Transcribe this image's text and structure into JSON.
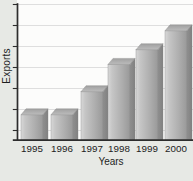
{
  "chart_data": {
    "type": "bar",
    "title": "",
    "categories": [
      "1995",
      "1996",
      "1997",
      "1998",
      "1999",
      "2000"
    ],
    "values": [
      1.2,
      1.2,
      2.3,
      3.6,
      4.3,
      5.2
    ],
    "values_note": "y-axis shows no numeric tick labels; values estimated in gridline divisions",
    "series_name": "Exports",
    "xlabel": "Years",
    "ylabel": "Exports",
    "ylim": [
      0,
      6.5
    ],
    "y_tick_count": 7,
    "x_tick_labels_visible": true,
    "y_tick_labels_visible": false,
    "grid": "horizontal",
    "legend": "none",
    "bar_style": "3d-oblique"
  },
  "colors": {
    "background": "#e7e9e5",
    "plot_background": "#fcfcfb",
    "gridline": "#dedede",
    "axis": "#2d2d2d",
    "text": "#1c1c1c",
    "bar_front_light": "#d8d8d8",
    "bar_front_mid": "#adadad",
    "bar_front_dark": "#999999",
    "bar_side_light": "#8f8f8f",
    "bar_side_dark": "#808080",
    "bar_top_back": "#a0a0a0",
    "bar_top_front": "#bcbcbc",
    "bar_edge": "#8a8a8a"
  }
}
